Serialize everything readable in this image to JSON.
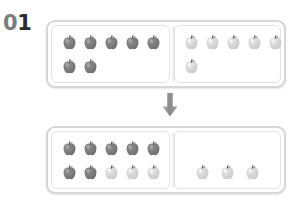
{
  "worksheet": {
    "problem_number": "01",
    "problem_number_digits": [
      "0",
      "1"
    ],
    "type": "apple-counting-regrouping",
    "arrow_icon": "arrow-down-icon"
  },
  "colors": {
    "page_background": "#ffffff",
    "frame_border": "#d6d6d6",
    "panel_border": "#e2e2e2",
    "divider": "#ededed",
    "apple_dark_body": "#6e6e6e",
    "apple_dark_highlight": "#8f8f8f",
    "apple_light_body": "#c9c9c9",
    "apple_light_highlight": "#e6e6e6",
    "apple_stem": "#5a5a5a",
    "digit_zero": "#7d7d7d",
    "digit_one": "#2b2b2b",
    "arrow": "#8a8a8a"
  },
  "frames": [
    {
      "id": "frame-top",
      "name": "top-frame",
      "left_panel": {
        "name": "top-left-panel",
        "total": 7,
        "rows": [
          {
            "name": "row-1",
            "apples": [
              "dark",
              "dark",
              "dark",
              "dark",
              "dark"
            ]
          },
          {
            "name": "row-2",
            "apples": [
              "dark",
              "dark"
            ]
          }
        ]
      },
      "right_panel": {
        "name": "top-right-panel",
        "total": 6,
        "align": "left",
        "rows": [
          {
            "name": "row-1",
            "apples": [
              "light",
              "light",
              "light",
              "light",
              "light"
            ]
          },
          {
            "name": "row-2",
            "apples": [
              "light"
            ]
          }
        ]
      }
    },
    {
      "id": "frame-bottom",
      "name": "bottom-frame",
      "left_panel": {
        "name": "bottom-left-panel",
        "total": 10,
        "rows": [
          {
            "name": "row-1",
            "apples": [
              "dark",
              "dark",
              "dark",
              "dark",
              "dark"
            ]
          },
          {
            "name": "row-2",
            "apples": [
              "dark",
              "dark",
              "light",
              "light",
              "light"
            ]
          }
        ]
      },
      "right_panel": {
        "name": "bottom-right-panel",
        "total": 3,
        "align": "center",
        "rows": [
          {
            "name": "row-1",
            "apples": []
          },
          {
            "name": "row-2",
            "apples": [
              "light",
              "light",
              "light"
            ]
          }
        ]
      }
    }
  ]
}
